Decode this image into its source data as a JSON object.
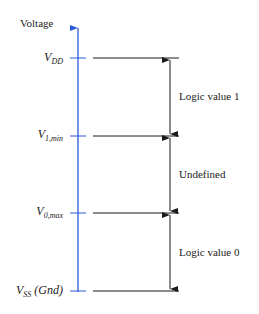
{
  "diagram": {
    "axis_label": "Voltage",
    "axis_color": "#2a5bd7",
    "line_color": "#1a1a1a",
    "levels": [
      {
        "main": "V",
        "sub": "DD",
        "suffix": "",
        "y": 58
      },
      {
        "main": "V",
        "sub": "1,min",
        "suffix": "",
        "y": 136
      },
      {
        "main": "V",
        "sub": "0,max",
        "suffix": "",
        "y": 213
      },
      {
        "main": "V",
        "sub": "SS",
        "suffix": " (Gnd)",
        "y": 291
      }
    ],
    "regions": [
      {
        "label": "Logic value 1"
      },
      {
        "label": "Undefined"
      },
      {
        "label": "Logic value 0"
      }
    ]
  }
}
